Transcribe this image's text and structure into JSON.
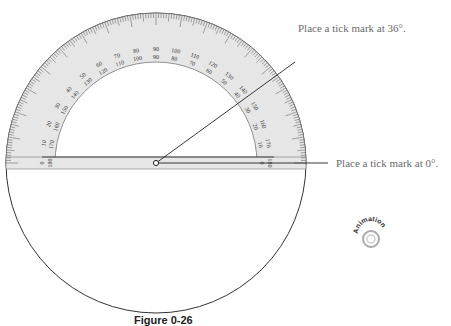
{
  "figure": {
    "caption": "Figure 0-26",
    "center": [
      156,
      163
    ],
    "circle_radius": 150,
    "protractor": {
      "outer_radius": 150,
      "inner_radius": 101,
      "label_radius_outer_scale": 112,
      "label_radius_inner_scale": 104,
      "band_color": "#e6e6e6",
      "outer_labels": [
        0,
        10,
        20,
        30,
        40,
        50,
        60,
        70,
        80,
        90,
        100,
        110,
        120,
        130,
        140,
        150,
        160,
        170,
        180
      ],
      "inner_labels": [
        180,
        170,
        160,
        150,
        140,
        130,
        120,
        110,
        100,
        90,
        80,
        70,
        60,
        50,
        40,
        30,
        20,
        10,
        0
      ]
    },
    "ray_angle_deg": 36,
    "callouts": [
      {
        "text": "Place a tick mark at 36°.",
        "x": 298,
        "y": 28
      },
      {
        "text": "Place a tick mark at 0°.",
        "x": 336,
        "y": 156
      }
    ],
    "animation_badge": {
      "label": "Animation"
    }
  }
}
